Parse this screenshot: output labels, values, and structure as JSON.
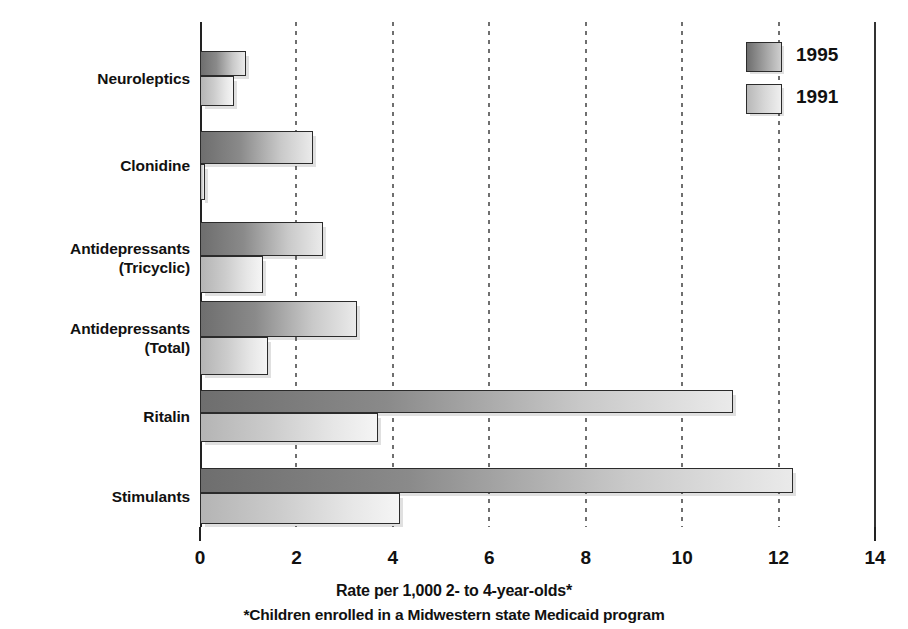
{
  "chart_data": {
    "type": "bar",
    "orientation": "horizontal",
    "title": "",
    "xlabel": "Rate per 1,000 2- to 4-year-olds*",
    "footnote": "*Children enrolled in a Midwestern state Medicaid program",
    "ylabel": "",
    "xlim": [
      0,
      14
    ],
    "xticks": [
      0,
      2,
      4,
      6,
      8,
      10,
      12,
      14
    ],
    "xtick_labels": [
      "0",
      "2",
      "4",
      "6",
      "8",
      "10",
      "12",
      "14"
    ],
    "grid": "vertical-dotted",
    "legend_position": "top-right",
    "categories": [
      "Neuroleptics",
      "Clonidine",
      "Antidepressants\n(Tricyclic)",
      "Antidepressants\n(Total)",
      "Ritalin",
      "Stimulants"
    ],
    "series": [
      {
        "name": "1995",
        "color": "#8a8a8a",
        "values": [
          0.95,
          2.35,
          2.55,
          3.25,
          11.05,
          12.3
        ]
      },
      {
        "name": "1991",
        "color": "#d0d0d0",
        "values": [
          0.7,
          0.1,
          1.3,
          1.4,
          3.7,
          4.15
        ]
      }
    ]
  },
  "legend": {
    "items": [
      {
        "label": "1995",
        "swatch": "y1995"
      },
      {
        "label": "1991",
        "swatch": "y1991"
      }
    ]
  },
  "axis": {
    "x_title": "Rate per 1,000 2- to 4-year-olds*",
    "footnote": "*Children enrolled in a Midwestern state Medicaid program"
  },
  "colors": {
    "bar_1995_dark": "#6e6e6e",
    "bar_1995_light": "#eaeaea",
    "bar_1991_dark": "#b4b4b4",
    "bar_1991_light": "#f5f5f5",
    "axis": "#222222",
    "text": "#111111",
    "background": "#ffffff"
  }
}
